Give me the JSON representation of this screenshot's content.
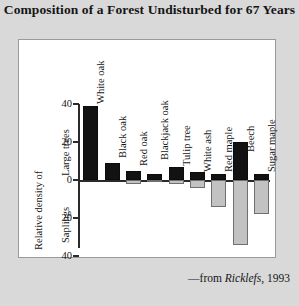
{
  "title": "Composition of a Forest Undisturbed for 67 Years",
  "credit": {
    "prefix": "—from ",
    "source": "Ricklefs",
    "suffix": ", 1993"
  },
  "axis": {
    "group_upper": "Large trees",
    "group_lower": "Saplings",
    "ylabel": "Relative density of",
    "tick_labels": [
      "40",
      "20",
      "0",
      "20",
      "40"
    ]
  },
  "colors": {
    "large_trees": "#121212",
    "saplings": "#c2c2c2",
    "axis": "#2a2a2a",
    "panel": "#ffffff",
    "background": "#d9d9d9"
  },
  "chart_data": {
    "type": "bar",
    "title": "Composition of a Forest Undisturbed for 67 Years",
    "xlabel": "",
    "ylabel": "Relative density of",
    "ylim": [
      -40,
      40
    ],
    "grid": false,
    "legend": "none",
    "orientation": "vertical",
    "note": "Positive values are large trees (black bars); negative values are saplings (gray bars).",
    "categories": [
      "White oak",
      "Black oak",
      "Red oak",
      "Blackjack oak",
      "Tulip tree",
      "White ash",
      "Red maple",
      "Beech",
      "Sugar maple"
    ],
    "series": [
      {
        "name": "Large trees",
        "color": "#121212",
        "values": [
          39,
          9,
          5,
          3,
          7,
          4,
          3,
          20,
          3
        ]
      },
      {
        "name": "Saplings",
        "color": "#c2c2c2",
        "values": [
          0,
          0,
          -2,
          -1,
          -2,
          -4,
          -14,
          -34,
          -18
        ]
      }
    ]
  }
}
